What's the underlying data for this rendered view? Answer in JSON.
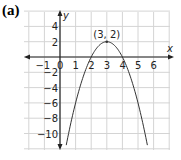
{
  "panel_label": "(a)",
  "chart_data": {
    "type": "line",
    "title": "(a)",
    "xlabel": "x",
    "ylabel": "y",
    "xlim": [
      -1.5,
      7.2
    ],
    "ylim": [
      -12,
      6
    ],
    "grid": true,
    "x_ticks": [
      -1,
      0,
      1,
      2,
      3,
      4,
      5,
      6
    ],
    "x_tick_labels": [
      "−1",
      "0",
      "1",
      "2",
      "3",
      "4",
      "5",
      "6"
    ],
    "y_ticks": [
      4,
      2,
      -2,
      -4,
      -6,
      -8,
      -10
    ],
    "y_tick_labels": [
      "4",
      "2",
      "−2",
      "−4",
      "−6",
      "−8",
      "−10"
    ],
    "series": [
      {
        "name": "y = -2(x - 3)^2 + 2",
        "equation": "y = -2(x-3)^2 + 2",
        "x": [
          0.45,
          1,
          1.5,
          2,
          2.5,
          3,
          3.5,
          4,
          4.5,
          5,
          5.55
        ],
        "y": [
          -11,
          -6,
          -2.5,
          0,
          1.5,
          2,
          1.5,
          0,
          -2.5,
          -6,
          -11
        ]
      }
    ],
    "annotations": [
      {
        "text": "(3, 2)",
        "x": 3,
        "y": 2,
        "type": "vertex"
      }
    ],
    "x_intercepts": [
      2,
      4
    ]
  }
}
